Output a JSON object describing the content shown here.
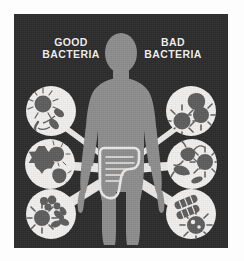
{
  "figure": {
    "type": "infographic",
    "background_color": "#2c2c2c",
    "body_color": "#8d8d8d",
    "circle_color": "#f0efee",
    "microbe_color": "#5d5d5d",
    "label_color": "#f2f2f2"
  },
  "labels": {
    "good": "GOOD\nBACTERIA",
    "bad": "BAD\nBACTERIA"
  },
  "center": {
    "body_name": "human-silhouette",
    "organ_name": "colon-intestine",
    "organ_outline_color": "#e8e8e6"
  },
  "callouts": {
    "good": [
      {
        "id": "good-1",
        "position": "top-left",
        "contents": "spiky-coccus-and-flagellated-rods"
      },
      {
        "id": "good-2",
        "position": "mid-left",
        "contents": "gear-spiky-cocci-and-blobs"
      },
      {
        "id": "good-3",
        "position": "bottom-left",
        "contents": "sun-spiky-coccus-cluster-and-rods"
      }
    ],
    "bad": [
      {
        "id": "bad-1",
        "position": "top-right",
        "contents": "spiky-viruses-and-blob"
      },
      {
        "id": "bad-2",
        "position": "mid-right",
        "contents": "irregular-blob-spiky-organism-and-curved-form"
      },
      {
        "id": "bad-3",
        "position": "bottom-right",
        "contents": "striped-rods-and-spiky-virus"
      }
    ]
  }
}
